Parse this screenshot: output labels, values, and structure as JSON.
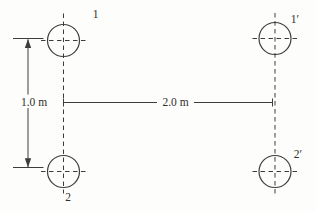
{
  "figure": {
    "conductors": [
      {
        "label": "1"
      },
      {
        "label": "1′"
      },
      {
        "label": "2"
      },
      {
        "label": "2′"
      }
    ],
    "dimensions": {
      "vertical_label": "1.0 m",
      "horizontal_label": "2.0 m"
    },
    "colors": {
      "line": "#3d3d3d",
      "text": "#2f2f2f",
      "background": "#fdfdfb"
    }
  }
}
